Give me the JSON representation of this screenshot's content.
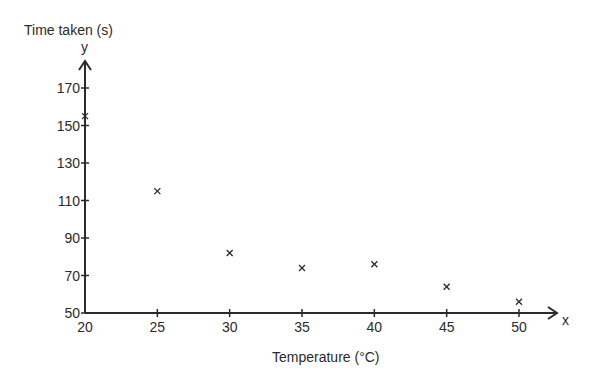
{
  "chart_data": {
    "type": "scatter",
    "title": "",
    "xlabel": "Temperature (°C)",
    "ylabel": "Time taken (s)",
    "x_axis_letter": "x",
    "y_axis_letter": "y",
    "xlim": [
      20,
      52
    ],
    "ylim": [
      50,
      182
    ],
    "x_ticks": [
      20,
      25,
      30,
      35,
      40,
      45,
      50
    ],
    "y_ticks": [
      50,
      70,
      90,
      110,
      130,
      150,
      170
    ],
    "grid": false,
    "legend": null,
    "marker": "x",
    "x": [
      20,
      25,
      30,
      35,
      40,
      45,
      50
    ],
    "y": [
      155,
      115,
      82,
      74,
      76,
      64,
      56
    ],
    "points": [
      {
        "x": 20,
        "y": 155
      },
      {
        "x": 25,
        "y": 115
      },
      {
        "x": 30,
        "y": 82
      },
      {
        "x": 35,
        "y": 74
      },
      {
        "x": 40,
        "y": 76
      },
      {
        "x": 45,
        "y": 64
      },
      {
        "x": 50,
        "y": 56
      }
    ]
  },
  "colors": {
    "axis": "#2b2b2b",
    "marker": "#2b2b2b",
    "background": "#ffffff"
  }
}
